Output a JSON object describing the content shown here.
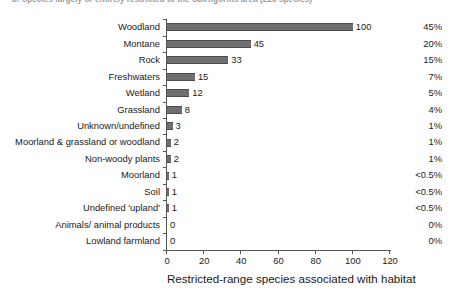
{
  "title": "b. Species largely or entirely restricted to the Cairngorms area (220 species)",
  "axis_title": "Restricted-range species associated with habitat",
  "colors": {
    "bar_fill": "#6f6f6f",
    "bar_edge": "#4d4d4d",
    "axis": "#555555",
    "text": "#1a1a1a",
    "title_text": "#9a9a9a",
    "background": "#ffffff"
  },
  "chart_data": {
    "type": "bar",
    "orientation": "horizontal",
    "title": "b. Species largely or entirely restricted to the Cairngorms area (220 species)",
    "xlabel": "Restricted-range species associated with habitat",
    "ylabel": "",
    "xlim": [
      0,
      120
    ],
    "xticks": [
      0,
      20,
      40,
      60,
      80,
      100,
      120
    ],
    "xtick_labels": [
      "0",
      "20",
      "40",
      "60",
      "80",
      "100",
      "120"
    ],
    "grid": false,
    "legend": false,
    "categories": [
      "Woodland",
      "Montane",
      "Rock",
      "Freshwaters",
      "Wetland",
      "Grassland",
      "Unknown/undefined",
      "Moorland & grassland or woodland",
      "Non-woody plants",
      "Moorland",
      "Soil",
      "Undefined 'upland'",
      "Animals/ animal products",
      "Lowland farmland"
    ],
    "values": [
      100,
      45,
      33,
      15,
      12,
      8,
      3,
      2,
      2,
      1,
      1,
      1,
      0,
      0
    ],
    "value_labels": [
      "100",
      "45",
      "33",
      "15",
      "12",
      "8",
      "3",
      "2",
      "2",
      "1",
      "1",
      "1",
      "0",
      "0"
    ],
    "percent_labels": [
      "45%",
      "20%",
      "15%",
      "7%",
      "5%",
      "4%",
      "1%",
      "1%",
      "1%",
      "<0.5%",
      "<0.5%",
      "<0.5%",
      "0%",
      "0%"
    ]
  }
}
